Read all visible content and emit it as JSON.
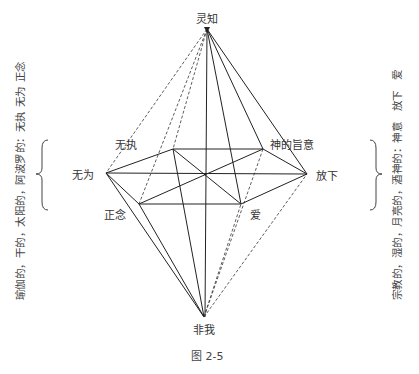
{
  "diagram": {
    "nodes": {
      "top": {
        "label": "灵知",
        "x": 207,
        "y": 29
      },
      "bottom": {
        "label": "非我",
        "x": 204,
        "y": 317
      },
      "left": {
        "label": "无为",
        "x": 106,
        "y": 173
      },
      "right": {
        "label": "放下",
        "x": 307,
        "y": 174
      },
      "upper_left": {
        "label": "无执",
        "x": 173,
        "y": 149
      },
      "upper_right": {
        "label": "神的旨意",
        "x": 263,
        "y": 149
      },
      "lower_left": {
        "label": "正念",
        "x": 139,
        "y": 204
      },
      "lower_right": {
        "label": "爱",
        "x": 241,
        "y": 204
      },
      "center": {
        "label": "",
        "x": 205,
        "y": 175
      }
    },
    "left_annotation": "瑜伽的，干的，太阳的，阿波罗的：无执 无为 正念",
    "right_annotation": "宗教的，湿的，月亮的，酒神的：神意　放下　爱",
    "caption": "图 2-5",
    "line_color": "#222222"
  }
}
